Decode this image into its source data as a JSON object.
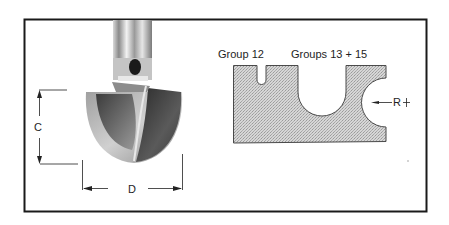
{
  "figure": {
    "frame": {
      "stroke": "#1a1a1a"
    },
    "router_bit": {
      "dimension_c_label": "C",
      "dimension_d_label": "D"
    },
    "profile": {
      "group_left_label": "Group 12",
      "group_right_label": "Groups 13 + 15",
      "radius_label": "R",
      "fill_color": "#c8c8c8"
    }
  }
}
